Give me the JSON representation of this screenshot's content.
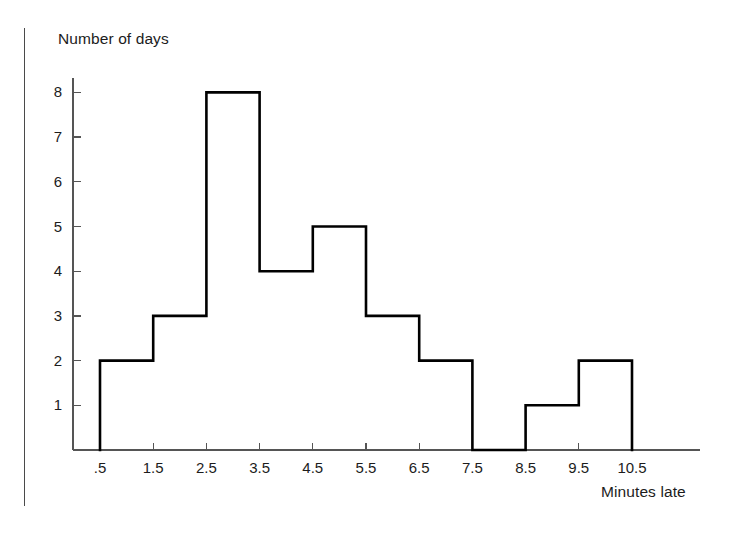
{
  "figure": {
    "y_axis_title": "Number of days",
    "x_axis_title": "Minutes late",
    "line_color": "#000000",
    "axis_color": "#555555",
    "background": "#ffffff"
  },
  "chart_data": {
    "type": "bar",
    "title": "",
    "subtitle": "",
    "xlabel": "Minutes late",
    "ylabel": "Number of days",
    "categories": [
      ".5-1.5",
      "1.5-2.5",
      "2.5-3.5",
      "3.5-4.5",
      "4.5-5.5",
      "5.5-6.5",
      "6.5-7.5",
      "7.5-8.5",
      "8.5-9.5",
      "9.5-10.5"
    ],
    "bin_edges": [
      0.5,
      1.5,
      2.5,
      3.5,
      4.5,
      5.5,
      6.5,
      7.5,
      8.5,
      9.5,
      10.5
    ],
    "values": [
      2,
      3,
      8,
      4,
      5,
      3,
      2,
      0,
      1,
      2
    ],
    "xtick_labels": [
      ".5",
      "1.5",
      "2.5",
      "3.5",
      "4.5",
      "5.5",
      "6.5",
      "7.5",
      "8.5",
      "9.5",
      "10.5"
    ],
    "xtick_values": [
      0.5,
      1.5,
      2.5,
      3.5,
      4.5,
      5.5,
      6.5,
      7.5,
      8.5,
      9.5,
      10.5
    ],
    "ytick_labels": [
      "1",
      "2",
      "3",
      "4",
      "5",
      "6",
      "7",
      "8"
    ],
    "ytick_values": [
      1,
      2,
      3,
      4,
      5,
      6,
      7,
      8
    ],
    "xlim": [
      0.5,
      10.5
    ],
    "ylim": [
      0,
      8.6
    ],
    "grid": false,
    "legend": false,
    "style": "outline-step-histogram",
    "total_days": 30
  }
}
